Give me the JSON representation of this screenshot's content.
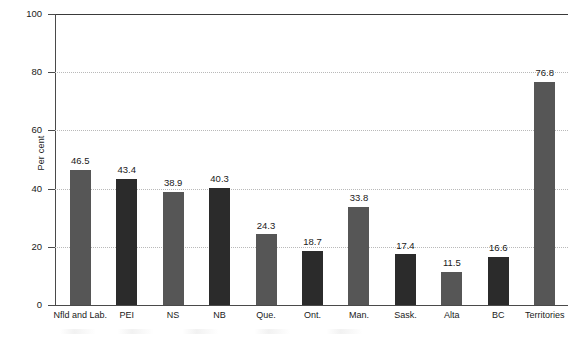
{
  "chart_data": {
    "type": "bar",
    "title": "",
    "subtitle": "",
    "xlabel": "",
    "ylabel": "Per cent",
    "ylim": [
      0,
      100
    ],
    "ytick_labels": [
      "0",
      "20",
      "40",
      "60",
      "80",
      "100"
    ],
    "ytick_values": [
      0,
      20,
      40,
      60,
      80,
      100
    ],
    "grid": "horizontal-dotted",
    "legend": "none",
    "categories": [
      "Nfld and Lab.",
      "PEI",
      "NS",
      "NB",
      "Que.",
      "Ont.",
      "Man.",
      "Sask.",
      "Alta",
      "BC",
      "Territories"
    ],
    "values": [
      46.5,
      43.4,
      38.9,
      40.3,
      24.3,
      18.7,
      33.8,
      17.4,
      11.5,
      16.6,
      76.8
    ],
    "value_labels": [
      "46.5",
      "43.4",
      "38.9",
      "40.3",
      "24.3",
      "18.7",
      "33.8",
      "17.4",
      "11.5",
      "16.6",
      "76.8"
    ],
    "bar_colors": [
      "#565656",
      "#2b2b2b",
      "#565656",
      "#2b2b2b",
      "#565656",
      "#2b2b2b",
      "#565656",
      "#2b2b2b",
      "#565656",
      "#2b2b2b",
      "#565656"
    ]
  },
  "style": {
    "background": "#ffffff",
    "axis_color": "#4a4a4a",
    "grid_color": "#b9b9b9",
    "text_color": "#1a1a1a",
    "bar_light": "#565656",
    "bar_dark": "#2b2b2b"
  }
}
